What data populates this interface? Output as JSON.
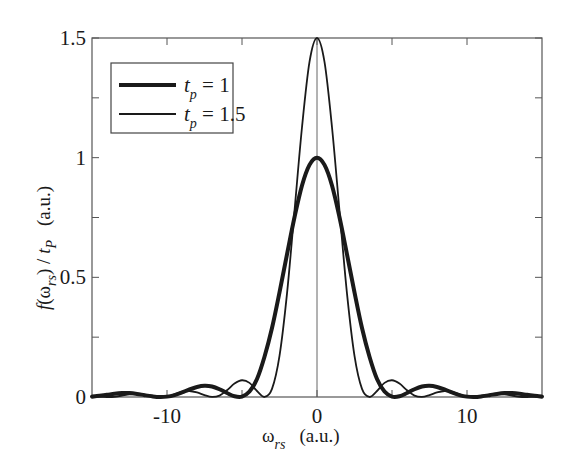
{
  "chart_data": {
    "type": "line",
    "title": "",
    "xlabel": "ω_rs (a.u.)",
    "ylabel": "f(ω_rs) / t_P (a.u.)",
    "xlim": [
      -15,
      15
    ],
    "ylim": [
      0,
      1.5
    ],
    "grid": false,
    "legend_position": "upper left",
    "x_ticks": [
      -10,
      0,
      10
    ],
    "x_tick_labels": [
      "-10",
      "0",
      "10"
    ],
    "x_minor_ticks": [
      -5,
      5
    ],
    "y_ticks": [
      0,
      0.5,
      1,
      1.5
    ],
    "y_tick_labels": [
      "0",
      "0.5",
      "1",
      "1.5"
    ],
    "y_minor_ticks": [
      0.25,
      0.75,
      1.25
    ],
    "vertical_reference_line_x": 0,
    "x": [
      0,
      0.5,
      1,
      1.5,
      2,
      2.5,
      3,
      3.5,
      4,
      4.5,
      5,
      5.5,
      6,
      6.5,
      7,
      7.5,
      8,
      8.5,
      9,
      9.5,
      10,
      10.5,
      11,
      11.5,
      12,
      12.5,
      13,
      13.5,
      14,
      14.5,
      15
    ],
    "symmetric_about_zero": true,
    "series": [
      {
        "name": "t_p = 1",
        "legend_label": "t_p = 1",
        "line_width": "thick",
        "color": "#1a1a1a",
        "values": [
          1.0,
          0.97,
          0.884,
          0.751,
          0.596,
          0.437,
          0.288,
          0.168,
          0.075,
          0.0227,
          0.0016,
          0.0029,
          0.0165,
          0.0324,
          0.0438,
          0.0469,
          0.042,
          0.0318,
          0.0189,
          0.008,
          0.0016,
          0.0001,
          0.003,
          0.0076,
          0.0128,
          0.0162,
          0.0162,
          0.0137,
          0.0091,
          0.0051,
          0.0015
        ]
      },
      {
        "name": "t_p = 1.5",
        "legend_label": "t_p = 1.5",
        "line_width": "thin",
        "color": "#1a1a1a",
        "values": [
          1.5,
          1.4,
          1.127,
          0.778,
          0.432,
          0.172,
          0.034,
          0.0001,
          0.025,
          0.059,
          0.07,
          0.056,
          0.028,
          0.006,
          0.0002,
          0.008,
          0.019,
          0.025,
          0.021,
          0.011,
          0.002,
          0.0001,
          0.004,
          0.01,
          0.012,
          0.011,
          0.006,
          0.001,
          0.0001,
          0.002,
          0.006
        ]
      }
    ]
  },
  "legend": {
    "items": [
      {
        "var": "t",
        "sub": "p",
        "eq": " = 1"
      },
      {
        "var": "t",
        "sub": "p",
        "eq": " = 1.5"
      }
    ]
  },
  "axes": {
    "xlabel_main": "ω",
    "xlabel_sub": "rs",
    "xlabel_unit": "(a.u.)",
    "ylabel_f": "f",
    "ylabel_open": "(ω",
    "ylabel_sub1": "rs",
    "ylabel_close": ") / ",
    "ylabel_t": "t",
    "ylabel_sub2": "P",
    "ylabel_unit": "(a.u.)"
  }
}
